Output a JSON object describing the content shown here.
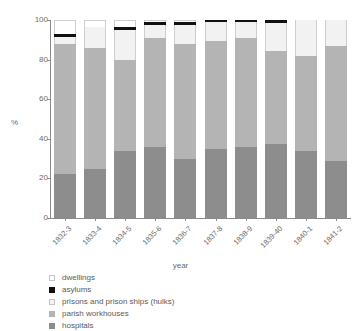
{
  "chart_data": {
    "type": "bar",
    "stacked": true,
    "normalized_percent": true,
    "title": "",
    "subtitle": "",
    "xlabel": "year",
    "ylabel": "%",
    "ylim": [
      0,
      100
    ],
    "yticks": [
      0,
      20,
      40,
      60,
      80,
      100
    ],
    "grid": false,
    "legend_position": "below-left",
    "categories": [
      "1832-3",
      "1833-4",
      "1834-5",
      "1835-6",
      "1836-7",
      "1837-8",
      "1838-9",
      "1839-40",
      "1840-1",
      "1841-2"
    ],
    "series": [
      {
        "name": "hospitals",
        "color": "#8d8d8d",
        "values": [
          22,
          25,
          34,
          36,
          30,
          35,
          36,
          37.5,
          34,
          29
        ]
      },
      {
        "name": "parish workhouses",
        "color": "#b4b4b4",
        "values": [
          66,
          61,
          46,
          55,
          58,
          54.5,
          55,
          47,
          48,
          58
        ]
      },
      {
        "name": "prisons and prison ships (hulks)",
        "color": "#f2f2f2",
        "values": [
          3.5,
          10.5,
          15,
          6.5,
          9.5,
          9.5,
          8,
          14,
          18,
          13
        ]
      },
      {
        "name": "asylums",
        "color": "#111111",
        "values": [
          1.5,
          0,
          1.5,
          1.5,
          1.5,
          1,
          1,
          1.5,
          0,
          0
        ]
      },
      {
        "name": "dwellings",
        "color": "#ffffff",
        "values": [
          7,
          3.5,
          3.5,
          1,
          1,
          0,
          0,
          0,
          0,
          0
        ]
      }
    ]
  },
  "legend": {
    "items": [
      {
        "label": "dwellings",
        "swatch_class": "sw-dwellings",
        "icon": "legend-swatch-dwellings"
      },
      {
        "label": "asylums",
        "swatch_class": "sw-asylums",
        "icon": "legend-swatch-asylums"
      },
      {
        "label": "prisons and prison ships (hulks)",
        "swatch_class": "sw-prisons",
        "icon": "legend-swatch-prisons"
      },
      {
        "label": "parish workhouses",
        "swatch_class": "sw-workhouses",
        "icon": "legend-swatch-workhouses"
      },
      {
        "label": "hospitals",
        "swatch_class": "sw-hospitals",
        "icon": "legend-swatch-hospitals"
      }
    ]
  },
  "colors": {
    "hospitals": "#8d8d8d",
    "parish_workhouses": "#b4b4b4",
    "prisons": "#f2f2f2",
    "asylums": "#111111",
    "dwellings": "#ffffff",
    "axis": "#8a8a8a",
    "text": "#6b6b6b"
  }
}
